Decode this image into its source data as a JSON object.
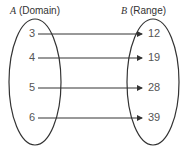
{
  "domain_label": {
    "set": "A",
    "text": "(Domain)"
  },
  "range_label": {
    "set": "B",
    "text": "(Range)"
  },
  "mapping": [
    {
      "from": "3",
      "to": "12"
    },
    {
      "from": "4",
      "to": "19"
    },
    {
      "from": "5",
      "to": "28"
    },
    {
      "from": "6",
      "to": "39"
    }
  ],
  "colors": {
    "line": "#333333",
    "text": "#555555"
  }
}
